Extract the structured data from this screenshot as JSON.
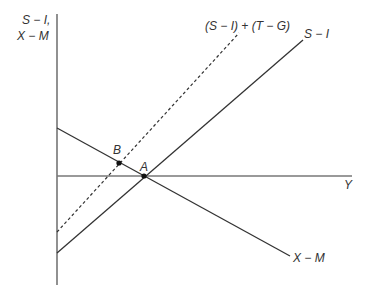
{
  "diagram": {
    "type": "economics-diagram",
    "y_axis_label_line1": "S − I,",
    "y_axis_label_line2": "X − M",
    "x_axis_label": "Y",
    "curves": [
      {
        "id": "s-minus-i",
        "label": "S − I",
        "style": "solid"
      },
      {
        "id": "s-minus-i-plus-t-minus-g",
        "label": "(S − I) + (T − G)",
        "style": "dashed"
      },
      {
        "id": "x-minus-m",
        "label": "X − M",
        "style": "solid"
      }
    ],
    "points": [
      {
        "id": "A",
        "label": "A",
        "description": "intersection of S − I and X − M on the Y axis"
      },
      {
        "id": "B",
        "label": "B",
        "description": "intersection of (S − I) + (T − G) and X − M"
      }
    ],
    "colors": {
      "axis": "#555555",
      "line": "#333333",
      "text": "#333333"
    }
  }
}
